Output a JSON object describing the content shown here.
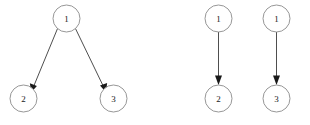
{
  "figure": {
    "background_color": "#ffffff",
    "node_fill": "#ffffff",
    "node_stroke": "#8a8a8a",
    "edge_color": "#3a3a3a",
    "arrow_color": "#1a1a1a",
    "label_color": "#1a1a1a"
  },
  "diagrams": [
    {
      "id": "left-graph",
      "name": "branching-graph",
      "nodes": [
        {
          "id": "L1",
          "label": "1",
          "cx": 66.5,
          "cy": 18.5,
          "r": 13.5
        },
        {
          "id": "L2",
          "label": "2",
          "cx": 23.5,
          "cy": 98.5,
          "r": 13.5
        },
        {
          "id": "L3",
          "label": "3",
          "cx": 113.5,
          "cy": 98.5,
          "r": 13.5
        }
      ],
      "edges": [
        {
          "id": "L1-L2",
          "from": "1",
          "to": "2",
          "directed": true
        },
        {
          "id": "L1-L3",
          "from": "1",
          "to": "3",
          "directed": true
        }
      ]
    },
    {
      "id": "right-graph",
      "name": "parallel-edges-graph",
      "nodes": [
        {
          "id": "R1a",
          "label": "1",
          "cx": 218.5,
          "cy": 18.5,
          "r": 13.5
        },
        {
          "id": "R2",
          "label": "2",
          "cx": 218.5,
          "cy": 98.5,
          "r": 13.5
        },
        {
          "id": "R1b",
          "label": "1",
          "cx": 276.5,
          "cy": 18.5,
          "r": 13.5
        },
        {
          "id": "R3",
          "label": "3",
          "cx": 276.5,
          "cy": 98.5,
          "r": 13.5
        }
      ],
      "edges": [
        {
          "id": "R1a-R2",
          "from": "1",
          "to": "2",
          "directed": true
        },
        {
          "id": "R1b-R3",
          "from": "1",
          "to": "3",
          "directed": true
        }
      ]
    }
  ]
}
